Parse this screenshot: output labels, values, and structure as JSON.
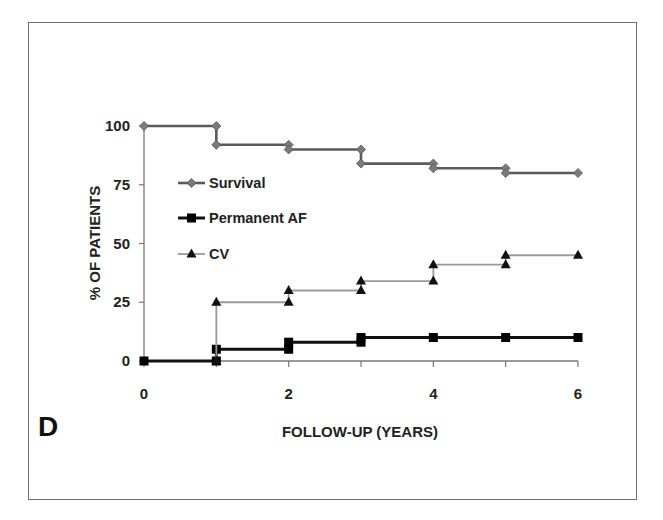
{
  "chart_data": {
    "type": "line",
    "step": true,
    "panel_label": "D",
    "title": "",
    "xlabel": "FOLLOW-UP (YEARS)",
    "ylabel": "% OF PATIENTS",
    "xlim": [
      0,
      6
    ],
    "ylim": [
      0,
      100
    ],
    "xticks": [
      0,
      1,
      2,
      3,
      4,
      5,
      6
    ],
    "xtick_labels": [
      "0",
      "",
      "2",
      "",
      "4",
      "",
      "6"
    ],
    "yticks": [
      0,
      25,
      50,
      75,
      100
    ],
    "ytick_labels": [
      "0",
      "25",
      "50",
      "75",
      "100"
    ],
    "grid": false,
    "legend_position": "upper-left-inside",
    "series": [
      {
        "name": "Survival",
        "marker": "diamond",
        "color": "#5a5a5a",
        "marker_color": "#7a7a7a",
        "points": [
          {
            "x": 0,
            "from": 100,
            "to": 100
          },
          {
            "x": 1,
            "from": 100,
            "to": 92
          },
          {
            "x": 2,
            "from": 92,
            "to": 90
          },
          {
            "x": 3,
            "from": 90,
            "to": 84
          },
          {
            "x": 4,
            "from": 84,
            "to": 82
          },
          {
            "x": 5,
            "from": 82,
            "to": 80
          },
          {
            "x": 6,
            "from": 80,
            "to": 80
          }
        ]
      },
      {
        "name": "Permanent AF",
        "marker": "square",
        "color": "#111111",
        "marker_color": "#000000",
        "points": [
          {
            "x": 0,
            "from": 0,
            "to": 0
          },
          {
            "x": 1,
            "from": 0,
            "to": 5
          },
          {
            "x": 2,
            "from": 5,
            "to": 8
          },
          {
            "x": 3,
            "from": 8,
            "to": 10
          },
          {
            "x": 4,
            "from": 10,
            "to": 10
          },
          {
            "x": 5,
            "from": 10,
            "to": 10
          },
          {
            "x": 6,
            "from": 10,
            "to": 10
          }
        ]
      },
      {
        "name": "CV",
        "marker": "triangle",
        "color": "#9a9a9a",
        "marker_color": "#111111",
        "points": [
          {
            "x": 1,
            "from": 0,
            "to": 25
          },
          {
            "x": 2,
            "from": 25,
            "to": 30
          },
          {
            "x": 3,
            "from": 30,
            "to": 34
          },
          {
            "x": 4,
            "from": 34,
            "to": 41
          },
          {
            "x": 5,
            "from": 41,
            "to": 45
          },
          {
            "x": 6,
            "from": 45,
            "to": 45
          }
        ]
      }
    ]
  }
}
